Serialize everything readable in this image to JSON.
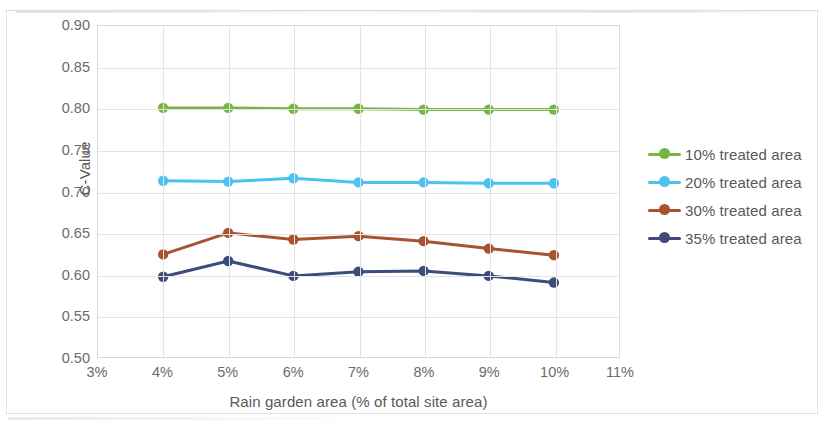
{
  "chart_data": {
    "type": "line",
    "title": "",
    "xlabel": "Rain garden area (% of total site area)",
    "ylabel": "C-Value",
    "x": [
      4,
      5,
      6,
      7,
      8,
      9,
      10
    ],
    "x_tick_labels": [
      "3%",
      "4%",
      "5%",
      "6%",
      "7%",
      "8%",
      "9%",
      "10%",
      "11%"
    ],
    "x_tick_values": [
      3,
      4,
      5,
      6,
      7,
      8,
      9,
      10,
      11
    ],
    "xlim": [
      3,
      11
    ],
    "y_tick_labels": [
      "0.90",
      "0.85",
      "0.80",
      "0.75",
      "0.70",
      "0.65",
      "0.60",
      "0.55",
      "0.50"
    ],
    "y_tick_values": [
      0.9,
      0.85,
      0.8,
      0.75,
      0.7,
      0.65,
      0.6,
      0.55,
      0.5
    ],
    "ylim": [
      0.5,
      0.9
    ],
    "grid": true,
    "legend_position": "right",
    "series": [
      {
        "name": "10% treated area",
        "color": "#76b743",
        "values": [
          0.801,
          0.801,
          0.8,
          0.8,
          0.799,
          0.799,
          0.799
        ]
      },
      {
        "name": "20% treated area",
        "color": "#4cc3ef",
        "values": [
          0.713,
          0.712,
          0.716,
          0.711,
          0.711,
          0.71,
          0.71
        ]
      },
      {
        "name": "30% treated area",
        "color": "#a9522f",
        "values": [
          0.624,
          0.65,
          0.642,
          0.646,
          0.64,
          0.631,
          0.623
        ]
      },
      {
        "name": "35% treated area",
        "color": "#3d4c7b",
        "values": [
          0.597,
          0.616,
          0.598,
          0.603,
          0.604,
          0.598,
          0.59
        ]
      }
    ]
  },
  "axis": {
    "y_title": "C-Value",
    "x_title": "Rain garden area (% of total site area)"
  },
  "legend": {
    "items": [
      {
        "label": "10% treated area",
        "color": "#76b743"
      },
      {
        "label": "20% treated area",
        "color": "#4cc3ef"
      },
      {
        "label": "30% treated area",
        "color": "#a9522f"
      },
      {
        "label": "35% treated area",
        "color": "#3d4c7b"
      }
    ]
  }
}
